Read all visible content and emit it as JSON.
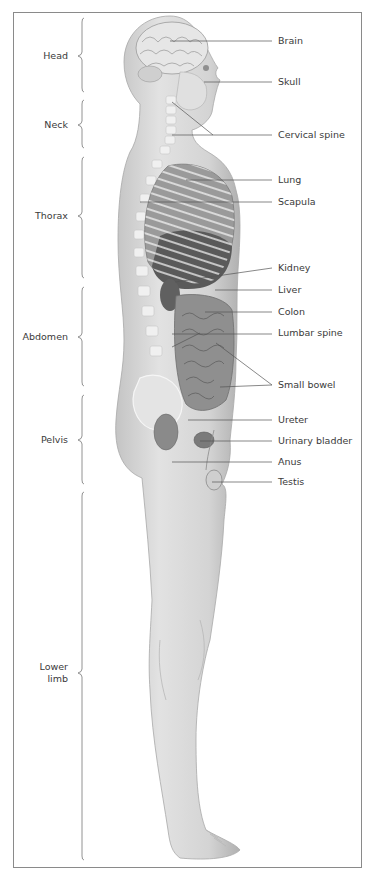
{
  "figure": {
    "colors": {
      "frame": "#8a8a8a",
      "text": "#3a3a3a",
      "skin": "#d9d9d9",
      "skin_shadow": "#bdbdbd",
      "organ_dark": "#4a4a4a",
      "organ_mid": "#8c8c8c",
      "bone": "#f2f2f2",
      "leader": "#555555"
    }
  },
  "regions": [
    {
      "label": "Head",
      "y": 50,
      "brace_top": 18,
      "brace_bottom": 92
    },
    {
      "label": "Neck",
      "y": 119,
      "brace_top": 100,
      "brace_bottom": 148
    },
    {
      "label": "Thorax",
      "y": 210,
      "brace_top": 157,
      "brace_bottom": 278
    },
    {
      "label": "Abdomen",
      "y": 331,
      "brace_top": 287,
      "brace_bottom": 386
    },
    {
      "label": "Pelvis",
      "y": 434,
      "brace_top": 395,
      "brace_bottom": 484
    },
    {
      "label": "Lower",
      "label2": "limb",
      "y": 661,
      "brace_top": 492,
      "brace_bottom": 860
    }
  ],
  "parts": [
    {
      "label": "Brain",
      "y": 35
    },
    {
      "label": "Skull",
      "y": 76
    },
    {
      "label": "Cervical spine",
      "y": 129
    },
    {
      "label": "Lung",
      "y": 174
    },
    {
      "label": "Scapula",
      "y": 196
    },
    {
      "label": "Kidney",
      "y": 262
    },
    {
      "label": "Liver",
      "y": 284
    },
    {
      "label": "Colon",
      "y": 306
    },
    {
      "label": "Lumbar spine",
      "y": 327
    },
    {
      "label": "Small bowel",
      "y": 379
    },
    {
      "label": "Ureter",
      "y": 414
    },
    {
      "label": "Urinary bladder",
      "y": 435
    },
    {
      "label": "Anus",
      "y": 456
    },
    {
      "label": "Testis",
      "y": 476
    }
  ]
}
